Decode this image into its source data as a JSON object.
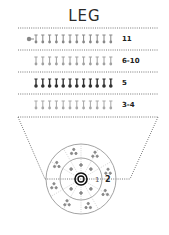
{
  "title": "LEG",
  "rows": [
    {
      "label": "11",
      "count": 12,
      "shade": "#888888",
      "has_lead": true
    },
    {
      "label": "6-10",
      "count": 12,
      "shade": "#a0a0a0",
      "has_lead": false
    },
    {
      "label": "5",
      "count": 12,
      "shade": "#333333",
      "has_lead": false
    },
    {
      "label": "3-4",
      "count": 12,
      "shade": "#a8a8a8",
      "has_lead": false
    }
  ],
  "diagram": {
    "ring_labels": [
      "1",
      "2"
    ],
    "colors": {
      "line": "#555555",
      "ring": "#999999",
      "center": "#111111"
    }
  }
}
